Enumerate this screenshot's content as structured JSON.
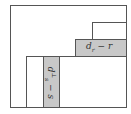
{
  "diagram": {
    "colors": {
      "stroke": "#555555",
      "fill_gray": "#c8c8c8",
      "background": "#ffffff"
    },
    "labels": {
      "horizontal_bar": {
        "base": "d",
        "sub": "r",
        "rest": " − r"
      },
      "vertical_bar": {
        "base": "d",
        "sub": "s",
        "sup": "⊥",
        "rest": " − s"
      }
    }
  }
}
